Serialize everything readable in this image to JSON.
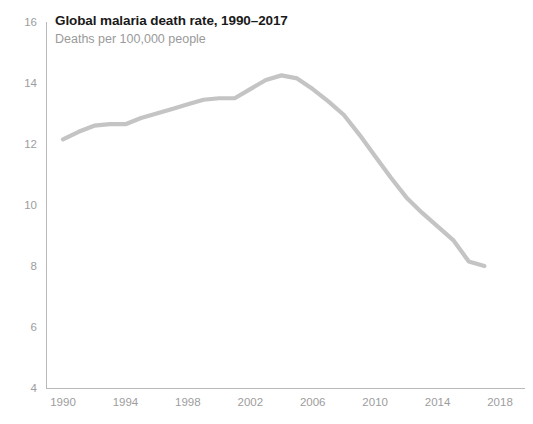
{
  "chart_data": {
    "type": "line",
    "title": "Global malaria death rate, 1990–2017",
    "subtitle": "Deaths per 100,000 people",
    "xlabel": "",
    "ylabel": "",
    "grid": false,
    "legend": "none",
    "xlim": [
      1989,
      2019
    ],
    "ylim": [
      4,
      16
    ],
    "ytick_labels": [
      "16",
      "14",
      "12",
      "10",
      "8",
      "6",
      "4"
    ],
    "yticks": [
      16,
      14,
      12,
      10,
      8,
      6,
      4
    ],
    "xtick_labels": [
      "1990",
      "1994",
      "1998",
      "2002",
      "2006",
      "2010",
      "2014",
      "2018"
    ],
    "xticks": [
      1990,
      1994,
      1998,
      2002,
      2006,
      2010,
      2014,
      2018
    ],
    "series": [
      {
        "name": "Global malaria death rate",
        "color": "#c4c4c4",
        "x": [
          1990,
          1991,
          1992,
          1993,
          1994,
          1995,
          1996,
          1997,
          1998,
          1999,
          2000,
          2001,
          2002,
          2003,
          2004,
          2005,
          2006,
          2007,
          2008,
          2009,
          2010,
          2011,
          2012,
          2013,
          2014,
          2015,
          2016,
          2017
        ],
        "values": [
          12.15,
          12.4,
          12.6,
          12.65,
          12.65,
          12.85,
          13.0,
          13.15,
          13.3,
          13.45,
          13.5,
          13.5,
          13.8,
          14.1,
          14.25,
          14.15,
          13.8,
          13.4,
          12.95,
          12.3,
          11.6,
          10.9,
          10.25,
          9.75,
          9.3,
          8.85,
          8.15,
          8.0
        ]
      }
    ]
  },
  "axis": {
    "y_axis_name": "y-axis",
    "x_axis_name": "x-axis"
  }
}
